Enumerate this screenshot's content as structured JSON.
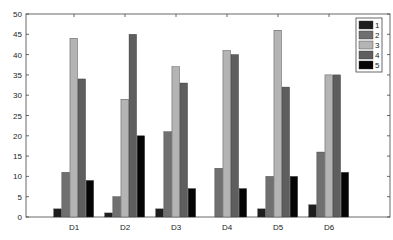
{
  "chart_data": {
    "type": "bar",
    "title": "",
    "xlabel": "",
    "ylabel": "",
    "categories": [
      "D1",
      "D2",
      "D3",
      "D4",
      "D5",
      "D6"
    ],
    "ylim": [
      0,
      50
    ],
    "yticks": [
      0,
      5,
      10,
      15,
      20,
      25,
      30,
      35,
      40,
      45,
      50
    ],
    "grid": false,
    "legend_position": "upper right",
    "series": [
      {
        "name": "1",
        "color": "#1e1e1e",
        "values": [
          2,
          1,
          2,
          0,
          2,
          3
        ]
      },
      {
        "name": "2",
        "color": "#707070",
        "values": [
          11,
          5,
          21,
          12,
          10,
          16
        ]
      },
      {
        "name": "3",
        "color": "#b4b4b4",
        "values": [
          44,
          29,
          37,
          41,
          46,
          35
        ]
      },
      {
        "name": "4",
        "color": "#5e5e5e",
        "values": [
          34,
          45,
          33,
          40,
          32,
          35
        ]
      },
      {
        "name": "5",
        "color": "#050505",
        "values": [
          9,
          20,
          7,
          7,
          10,
          11
        ]
      }
    ]
  }
}
